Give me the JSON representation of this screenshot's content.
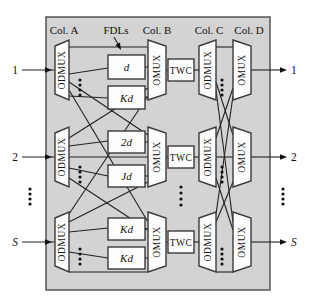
{
  "column_headers": {
    "col_a": "Col. A",
    "fdls": "FDLs",
    "col_b": "Col. B",
    "col_c": "Col. C",
    "col_d": "Col. D"
  },
  "blocks": {
    "odmux": "ODMUX",
    "omux": "OMUX",
    "twc": "TWC"
  },
  "rows": [
    {
      "input": "1",
      "output": "1",
      "fdl_top": "d",
      "fdl_bottom": "Kd"
    },
    {
      "input": "2",
      "output": "2",
      "fdl_top": "2d",
      "fdl_bottom": "Jd"
    },
    {
      "input": "S",
      "output": "S",
      "fdl_top": "Kd",
      "fdl_bottom": "Kd"
    }
  ],
  "colors": {
    "background": "#ffffff",
    "panel_fill": "#d3d3d3",
    "box_fill": "#fdfdfd",
    "stroke": "#3a3a3a",
    "line": "#222222",
    "text": "#111111"
  }
}
